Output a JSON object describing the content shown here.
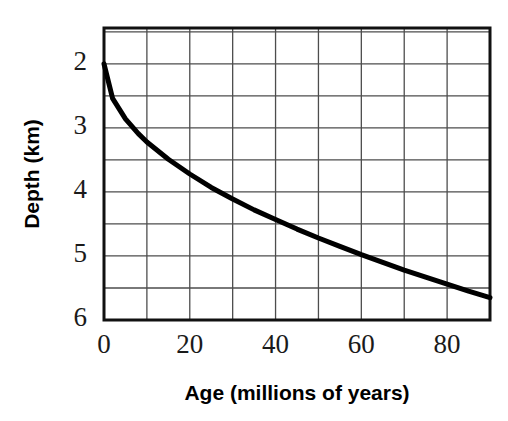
{
  "chart_data": {
    "type": "line",
    "title": "",
    "subtitle": "",
    "xlabel": "Age (millions of years)",
    "ylabel": "Depth (km)",
    "xlim": [
      0,
      90
    ],
    "ylim": [
      6,
      1.44
    ],
    "y_axis_inverted": true,
    "grid": true,
    "legend": "none",
    "x_ticks": [
      0,
      20,
      40,
      60,
      80
    ],
    "x_tick_labels": [
      "0",
      "20",
      "40",
      "60",
      "80"
    ],
    "x_gridline_step": 10,
    "y_ticks": [
      2,
      3,
      4,
      5,
      6
    ],
    "y_tick_labels": [
      "2",
      "3",
      "4",
      "5",
      "6"
    ],
    "y_gridline_step": 0.5,
    "series": [
      {
        "name": "Ocean floor depth",
        "line_color": "#000000",
        "line_width": 5,
        "x": [
          0,
          2,
          5,
          8,
          10,
          15,
          20,
          25,
          30,
          35,
          40,
          45,
          50,
          55,
          60,
          65,
          70,
          75,
          80,
          85,
          90
        ],
        "y": [
          2.0,
          2.54,
          2.86,
          3.09,
          3.22,
          3.49,
          3.72,
          3.93,
          4.11,
          4.28,
          4.43,
          4.58,
          4.72,
          4.85,
          4.98,
          5.1,
          5.22,
          5.33,
          5.44,
          5.55,
          5.65
        ]
      }
    ],
    "colors": {
      "background": "#ffffff",
      "axis": "#111111",
      "grid": "#4d4d4d",
      "curve": "#000000",
      "text": "#111111"
    }
  },
  "plot": {
    "left_px": 104,
    "right_px": 490,
    "top_px": 28,
    "bottom_px": 320
  },
  "labels": {
    "x_axis_title": "Age (millions of years)",
    "y_axis_title": "Depth (km)"
  }
}
